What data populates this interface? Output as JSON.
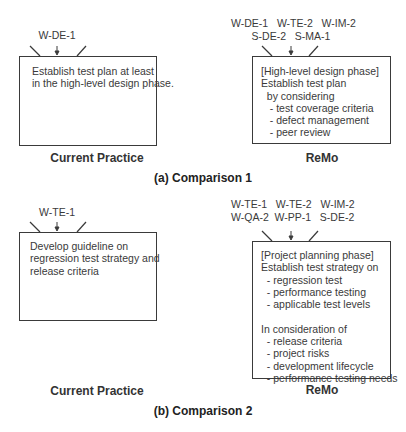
{
  "comparisons": [
    {
      "caption": "(a) Comparison 1",
      "current_practice": {
        "label": "Current Practice",
        "tags": [
          "W-DE-1"
        ],
        "text": "Establish test plan at least\nin the high-level design phase."
      },
      "remo": {
        "label": "ReMo",
        "tags": [
          "W-DE-1   W-TE-2   W-IM-2",
          "S-DE-2   S-MA-1"
        ],
        "text": "[High-level design phase]\nEstablish test plan\n  by considering\n   - test coverage criteria\n   - defect management\n   - peer review"
      }
    },
    {
      "caption": "(b) Comparison 2",
      "current_practice": {
        "label": "Current Practice",
        "tags": [
          "W-TE-1"
        ],
        "text": "Develop guideline on\nregression test strategy and\nrelease criteria"
      },
      "remo": {
        "label": "ReMo",
        "tags": [
          "W-TE-1   W-TE-2   W-IM-2",
          "W-QA-2  W-PP-1   S-DE-2"
        ],
        "text": "[Project planning phase]\nEstablish test strategy on\n  - regression test\n  - performance testing\n  - applicable test levels\n\nIn consideration of\n  - release criteria\n  - project risks\n  - development lifecycle\n  - performance testing needs"
      }
    }
  ],
  "icons": {
    "arrow": "down-arrow",
    "callout_ticks": "callout-notch"
  }
}
